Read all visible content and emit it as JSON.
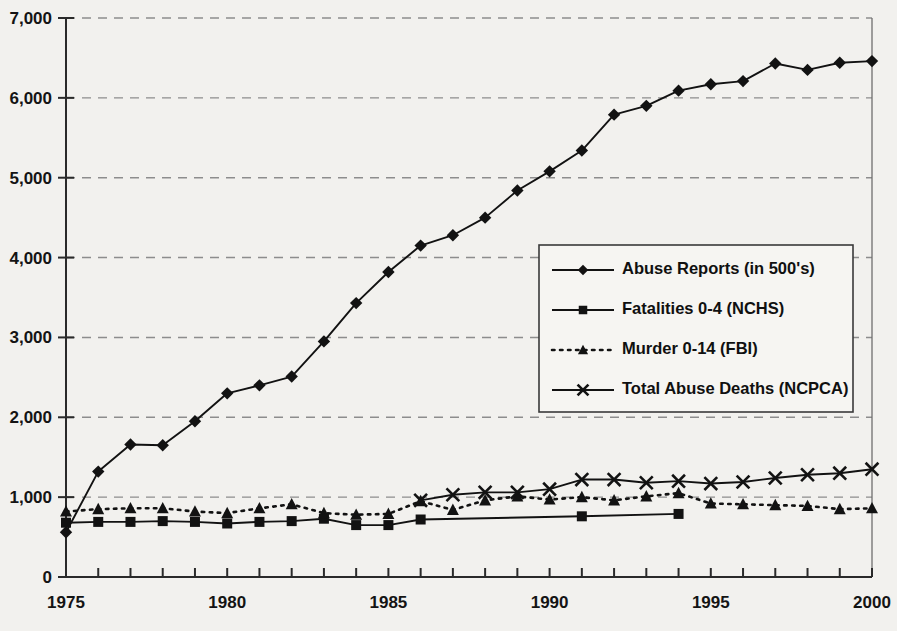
{
  "chart_data": {
    "type": "line",
    "title": "",
    "subtitle": "",
    "xlabel": "",
    "ylabel": "",
    "xlim": [
      1975,
      2000
    ],
    "ylim": [
      0,
      7000
    ],
    "grid": true,
    "legend_position": "center-right",
    "y_ticks": [
      "0",
      "1,000",
      "2,000",
      "3,000",
      "4,000",
      "5,000",
      "6,000",
      "7,000"
    ],
    "y_tick_values": [
      0,
      1000,
      2000,
      3000,
      4000,
      5000,
      6000,
      7000
    ],
    "x_ticks": [
      "1975",
      "1980",
      "1985",
      "1990",
      "1995",
      "2000"
    ],
    "x_tick_values": [
      1975,
      1980,
      1985,
      1990,
      1995,
      2000
    ],
    "x_minor_tick_values": [
      1976,
      1977,
      1978,
      1979,
      1981,
      1982,
      1983,
      1984,
      1986,
      1987,
      1988,
      1989,
      1991,
      1992,
      1993,
      1994,
      1996,
      1997,
      1998,
      1999
    ],
    "series": [
      {
        "name": "Abuse Reports (in 500's)",
        "marker": "diamond",
        "linestyle": "solid",
        "color": "#121212",
        "x": [
          1975,
          1976,
          1977,
          1978,
          1979,
          1980,
          1981,
          1982,
          1983,
          1984,
          1985,
          1986,
          1987,
          1988,
          1989,
          1990,
          1991,
          1992,
          1993,
          1994,
          1995,
          1996,
          1997,
          1998,
          1999,
          2000
        ],
        "values": [
          560,
          1320,
          1660,
          1650,
          1950,
          2300,
          2400,
          2510,
          2950,
          3430,
          3820,
          4150,
          4280,
          4500,
          4840,
          5080,
          5340,
          5790,
          5900,
          6090,
          6170,
          6210,
          6430,
          6350,
          6440,
          6460
        ]
      },
      {
        "name": "Fatalities 0-4 (NCHS)",
        "marker": "square",
        "linestyle": "solid",
        "color": "#121212",
        "x": [
          1975,
          1976,
          1977,
          1978,
          1979,
          1980,
          1981,
          1982,
          1983,
          1984,
          1985,
          1986,
          1991,
          1994
        ],
        "values": [
          680,
          690,
          690,
          700,
          690,
          670,
          690,
          700,
          730,
          650,
          650,
          720,
          760,
          790
        ]
      },
      {
        "name": "Murder 0-14 (FBI)",
        "marker": "triangle",
        "linestyle": "dotted",
        "color": "#121212",
        "x": [
          1975,
          1976,
          1977,
          1978,
          1979,
          1980,
          1981,
          1982,
          1983,
          1984,
          1985,
          1986,
          1987,
          1988,
          1989,
          1990,
          1991,
          1992,
          1993,
          1994,
          1995,
          1996,
          1997,
          1998,
          1999,
          2000
        ],
        "values": [
          820,
          850,
          860,
          860,
          820,
          800,
          860,
          910,
          800,
          780,
          790,
          950,
          840,
          960,
          1010,
          970,
          1000,
          960,
          1010,
          1050,
          920,
          910,
          900,
          890,
          850,
          860
        ]
      },
      {
        "name": "Total Abuse Deaths (NCPCA)",
        "marker": "x",
        "linestyle": "solid",
        "color": "#121212",
        "x": [
          1986,
          1987,
          1988,
          1989,
          1990,
          1991,
          1992,
          1993,
          1994,
          1995,
          1996,
          1997,
          1998,
          1999,
          2000
        ],
        "values": [
          960,
          1030,
          1060,
          1060,
          1100,
          1220,
          1220,
          1180,
          1200,
          1170,
          1190,
          1240,
          1280,
          1300,
          1350
        ]
      }
    ]
  },
  "legend": {
    "entries": [
      {
        "label": "Abuse Reports (in 500's)",
        "marker": "diamond",
        "linestyle": "solid"
      },
      {
        "label": "Fatalities 0-4 (NCHS)",
        "marker": "square",
        "linestyle": "solid"
      },
      {
        "label": "Murder 0-14 (FBI)",
        "marker": "triangle",
        "linestyle": "dotted"
      },
      {
        "label": "Total Abuse Deaths (NCPCA)",
        "marker": "x",
        "linestyle": "solid"
      }
    ]
  },
  "colors": {
    "ink": "#121212",
    "grid": "#8d8d8d",
    "background": "#f2f1ee"
  }
}
